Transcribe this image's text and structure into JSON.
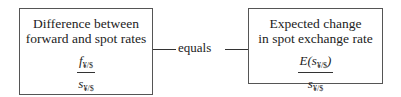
{
  "left_box": {
    "title_line1": "Difference between",
    "title_line2": "forward and spot rates",
    "numerator_var": "f",
    "numerator_sub": "¥/$",
    "denominator_var": "s",
    "denominator_sub": "¥/$"
  },
  "connector": {
    "label": "equals"
  },
  "right_box": {
    "title_line1": "Expected change",
    "title_line2": "in spot exchange rate",
    "numerator_prefix": "E(",
    "numerator_var": "s",
    "numerator_sub": "¥/$",
    "numerator_suffix": ")",
    "denominator_var": "s",
    "denominator_sub": "¥/$"
  }
}
